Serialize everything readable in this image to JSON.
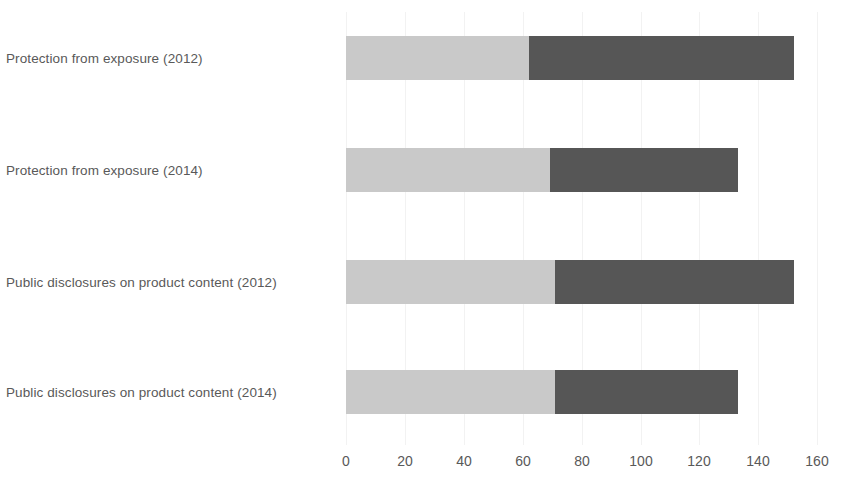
{
  "chart_data": {
    "type": "bar",
    "orientation": "horizontal",
    "stacked": true,
    "title": "",
    "xlabel": "",
    "ylabel": "",
    "xlim": [
      0,
      160
    ],
    "xticks": [
      0,
      20,
      40,
      60,
      80,
      100,
      120,
      140,
      160
    ],
    "xtick_labels": [
      "0",
      "20",
      "40",
      "60",
      "80",
      "100",
      "120",
      "140",
      "160"
    ],
    "grid": true,
    "grid_axis": "x",
    "legend": false,
    "categories": [
      "Protection from exposure (2012)",
      "Protection from exposure (2014)",
      "Public disclosures on product content (2012)",
      "Public disclosures on product content (2014)"
    ],
    "series": [
      {
        "name": "Segment 1",
        "color": "#c9c9c9",
        "values": [
          62,
          69,
          71,
          71
        ]
      },
      {
        "name": "Segment 2",
        "color": "#565656",
        "values": [
          90,
          64,
          81,
          62
        ]
      }
    ],
    "totals": [
      152,
      133,
      152,
      133
    ]
  },
  "style": {
    "background": "#ffffff",
    "label_color": "#595959",
    "gridline_color": "#f2f2f2",
    "light_segment_color": "#c9c9c9",
    "dark_segment_color": "#565656"
  }
}
